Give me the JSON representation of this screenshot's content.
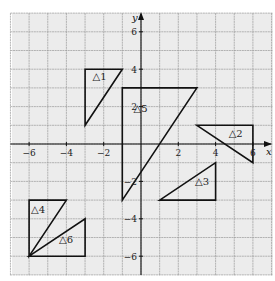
{
  "diagram": {
    "type": "coordinate-grid",
    "x_axis": {
      "label": "x",
      "ticks": [
        -6,
        -4,
        -2,
        2,
        4,
        6
      ],
      "range": [
        -7,
        7
      ]
    },
    "y_axis": {
      "label": "y",
      "ticks": [
        6,
        4,
        2,
        -2,
        -4,
        -6
      ],
      "range": [
        -7,
        7
      ]
    },
    "grid": {
      "step": 1,
      "color": "#9a9a9a",
      "background": "#ececec"
    },
    "triangles": [
      {
        "label": "△1",
        "vertices": [
          [
            -3,
            4
          ],
          [
            -1,
            4
          ],
          [
            -3,
            1
          ]
        ],
        "label_at": [
          -2.6,
          3.4
        ]
      },
      {
        "label": "△2",
        "vertices": [
          [
            3,
            1
          ],
          [
            6,
            1
          ],
          [
            6,
            -1
          ]
        ],
        "label_at": [
          4.7,
          0.4
        ]
      },
      {
        "label": "△3",
        "vertices": [
          [
            1,
            -3
          ],
          [
            4,
            -3
          ],
          [
            4,
            -1
          ]
        ],
        "label_at": [
          2.9,
          -2.2
        ]
      },
      {
        "label": "△4",
        "vertices": [
          [
            -6,
            -3
          ],
          [
            -4,
            -3
          ],
          [
            -6,
            -6
          ]
        ],
        "label_at": [
          -5.9,
          -3.7
        ]
      },
      {
        "label": "△5",
        "vertices": [
          [
            -1,
            3
          ],
          [
            3,
            3
          ],
          [
            -1,
            -3
          ]
        ],
        "label_at": [
          -0.4,
          1.7
        ]
      },
      {
        "label": "△6",
        "vertices": [
          [
            -6,
            -6
          ],
          [
            -3,
            -4
          ],
          [
            -3,
            -6
          ]
        ],
        "label_at": [
          -4.4,
          -5.3
        ]
      }
    ]
  }
}
